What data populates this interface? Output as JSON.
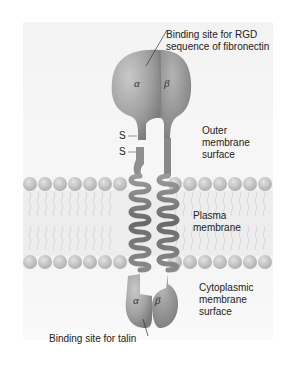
{
  "figure": {
    "type": "integrin structure in plasma membrane",
    "labels": {
      "top_binding_site_line1": "Binding site for RGD",
      "top_binding_site_line2": "sequence of fibronectin",
      "outer_line1": "Outer",
      "outer_line2": "membrane",
      "outer_line3": "surface",
      "plasma_line1": "Plasma",
      "plasma_line2": "membrane",
      "cyto_line1": "Cytoplasmic",
      "cyto_line2": "membrane",
      "cyto_line3": "surface",
      "bottom_binding_site": "Binding site for talin"
    },
    "subunits": {
      "alpha": "α",
      "beta": "β"
    },
    "disulfide": {
      "s1": "S",
      "s2": "S"
    },
    "colors": {
      "protein_alpha": "#9a9a9a",
      "protein_beta": "#8c8c8c",
      "lipid_head": "#c4c4c4",
      "panel_bg": "#f4f4f4"
    }
  }
}
